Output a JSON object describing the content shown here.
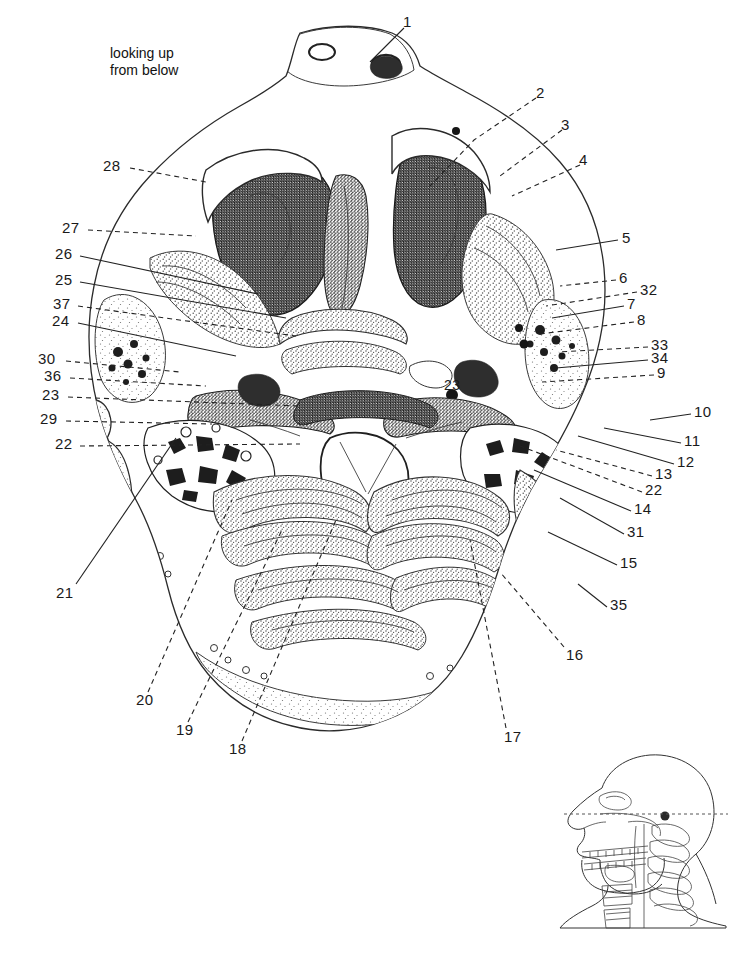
{
  "figure": {
    "type": "anatomical-cross-section",
    "caption": "looking up\nfrom below",
    "region": "head",
    "plane": "axial",
    "background_color": "#ffffff",
    "ink_color": "#1a1a1a"
  },
  "labels": {
    "top": [
      {
        "id": "1",
        "text": "1",
        "x": 407,
        "y": 22
      },
      {
        "id": "2",
        "text": "2",
        "x": 540,
        "y": 93
      },
      {
        "id": "3",
        "text": "3",
        "x": 565,
        "y": 125
      },
      {
        "id": "4",
        "text": "4",
        "x": 583,
        "y": 160
      }
    ],
    "right": [
      {
        "id": "5",
        "text": "5",
        "x": 622,
        "y": 237
      },
      {
        "id": "6",
        "text": "6",
        "x": 619,
        "y": 277
      },
      {
        "id": "32",
        "text": "32",
        "x": 640,
        "y": 289
      },
      {
        "id": "7",
        "text": "7",
        "x": 627,
        "y": 303
      },
      {
        "id": "8",
        "text": "8",
        "x": 637,
        "y": 319
      },
      {
        "id": "33",
        "text": "33",
        "x": 651,
        "y": 344
      },
      {
        "id": "34",
        "text": "34",
        "x": 651,
        "y": 357
      },
      {
        "id": "9",
        "text": "9",
        "x": 657,
        "y": 372
      },
      {
        "id": "10",
        "text": "10",
        "x": 694,
        "y": 411
      },
      {
        "id": "11",
        "text": "11",
        "x": 684,
        "y": 440
      },
      {
        "id": "12",
        "text": "12",
        "x": 677,
        "y": 461
      },
      {
        "id": "13",
        "text": "13",
        "x": 655,
        "y": 473
      },
      {
        "id": "22r",
        "text": "22",
        "x": 645,
        "y": 489
      },
      {
        "id": "14",
        "text": "14",
        "x": 634,
        "y": 508
      },
      {
        "id": "31",
        "text": "31",
        "x": 627,
        "y": 531
      },
      {
        "id": "15",
        "text": "15",
        "x": 620,
        "y": 562
      },
      {
        "id": "35",
        "text": "35",
        "x": 610,
        "y": 604
      }
    ],
    "left": [
      {
        "id": "28",
        "text": "28",
        "x": 103,
        "y": 165
      },
      {
        "id": "27",
        "text": "27",
        "x": 62,
        "y": 227
      },
      {
        "id": "26",
        "text": "26",
        "x": 55,
        "y": 253
      },
      {
        "id": "25",
        "text": "25",
        "x": 55,
        "y": 279
      },
      {
        "id": "37",
        "text": "37",
        "x": 53,
        "y": 303
      },
      {
        "id": "24",
        "text": "24",
        "x": 52,
        "y": 320
      },
      {
        "id": "30",
        "text": "30",
        "x": 38,
        "y": 358
      },
      {
        "id": "36",
        "text": "36",
        "x": 44,
        "y": 375
      },
      {
        "id": "23",
        "text": "23",
        "x": 42,
        "y": 394
      },
      {
        "id": "29",
        "text": "29",
        "x": 40,
        "y": 418
      },
      {
        "id": "22",
        "text": "22",
        "x": 55,
        "y": 443
      }
    ],
    "bottom": [
      {
        "id": "21",
        "text": "21",
        "x": 56,
        "y": 592
      },
      {
        "id": "20",
        "text": "20",
        "x": 136,
        "y": 699
      },
      {
        "id": "19",
        "text": "19",
        "x": 176,
        "y": 729
      },
      {
        "id": "18",
        "text": "18",
        "x": 229,
        "y": 748
      },
      {
        "id": "17",
        "text": "17",
        "x": 504,
        "y": 736
      },
      {
        "id": "16",
        "text": "16",
        "x": 566,
        "y": 654
      }
    ],
    "inline": [
      {
        "id": "23-inline",
        "text": "23",
        "x": 444,
        "y": 385
      }
    ]
  },
  "inset": {
    "name": "lateral-skull-inset",
    "description": "lateral view of skull and cervical spine with section-level line",
    "x": 540,
    "y": 755,
    "width": 190,
    "height": 170
  }
}
